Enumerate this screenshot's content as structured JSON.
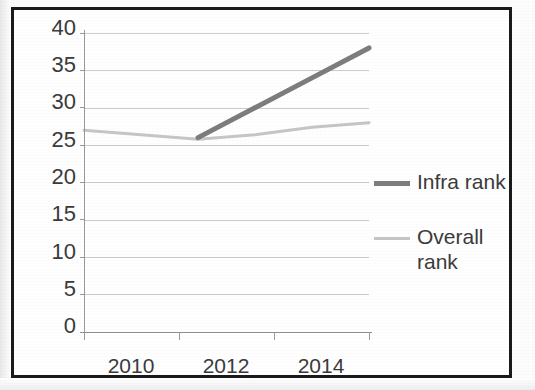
{
  "chart_data": {
    "type": "line",
    "title": "",
    "xlabel": "",
    "ylabel": "",
    "x": [
      2010,
      2011,
      2012,
      2013,
      2014,
      2015
    ],
    "x_tick_labels": [
      "2010",
      "2012",
      "2014"
    ],
    "y_tick_labels": [
      "0",
      "5",
      "10",
      "15",
      "20",
      "25",
      "30",
      "35",
      "40"
    ],
    "ylim": [
      0,
      40
    ],
    "y_tick_step": 5,
    "grid": true,
    "legend_position": "right",
    "series": [
      {
        "name": "Infra rank",
        "color": "#7d7d7d",
        "line_width": 5,
        "x": [
          2012,
          2013,
          2014,
          2015
        ],
        "values": [
          26,
          30,
          34,
          38
        ]
      },
      {
        "name": "Overall rank",
        "color": "#c6c6c6",
        "line_width": 3,
        "x": [
          2010,
          2011,
          2012,
          2013,
          2014,
          2015
        ],
        "values": [
          27,
          26.4,
          25.8,
          26.4,
          27.4,
          28
        ]
      }
    ]
  },
  "axes": {
    "y_labels": [
      "40",
      "35",
      "30",
      "25",
      "20",
      "15",
      "10",
      "5",
      "0"
    ],
    "x_labels": [
      "2010",
      "2012",
      "2014"
    ]
  },
  "legend": {
    "items": [
      {
        "label": "Infra rank",
        "color": "#7d7d7d"
      },
      {
        "label": "Overall\nrank",
        "color": "#c6c6c6"
      }
    ]
  }
}
